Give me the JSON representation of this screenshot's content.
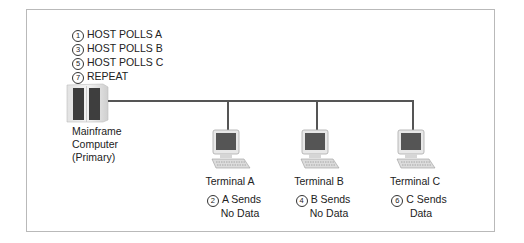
{
  "diagram": {
    "host_steps": [
      {
        "num": "1",
        "text": "HOST POLLS  A"
      },
      {
        "num": "3",
        "text": "HOST POLLS B"
      },
      {
        "num": "5",
        "text": "HOST POLLS C"
      },
      {
        "num": "7",
        "text": "REPEAT"
      }
    ],
    "mainframe": {
      "icon": "mainframe-icon",
      "label_lines": [
        "Mainframe",
        "Computer",
        "(Primary)"
      ]
    },
    "terminals": [
      {
        "name": "Terminal A",
        "icon": "terminal-icon",
        "step_num": "2",
        "step_line1": "A Sends",
        "step_line2": "No Data"
      },
      {
        "name": "Terminal B",
        "icon": "terminal-icon",
        "step_num": "4",
        "step_line1": "B Sends",
        "step_line2": "No Data"
      },
      {
        "name": "Terminal C",
        "icon": "terminal-icon",
        "step_num": "6",
        "step_line1": "C Sends",
        "step_line2": "Data"
      }
    ],
    "colors": {
      "line": "#555555",
      "border": "#b9b9b9"
    }
  }
}
